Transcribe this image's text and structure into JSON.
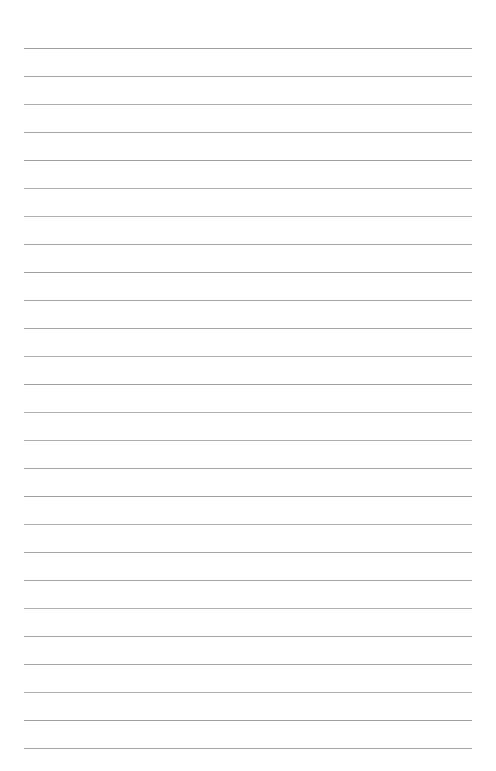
{
  "document": {
    "kind": "lined-paper",
    "title": "",
    "body_text": "",
    "page_number": "",
    "header_text": "",
    "footer_text": ""
  },
  "canvas": {
    "width": 496,
    "height": 771,
    "background_color": "#ffffff"
  },
  "ruling": {
    "line_color": "#9e9e9e",
    "line_thickness_px": 1,
    "line_spacing_px": 28,
    "first_line_y_px": 48,
    "last_line_y_px": 748,
    "line_start_x_px": 24,
    "line_end_x_px": 472,
    "line_count": 26,
    "lines_y": [
      48,
      76,
      104,
      132,
      160,
      188,
      216,
      244,
      272,
      300,
      328,
      356,
      384,
      412,
      440,
      468,
      496,
      524,
      552,
      580,
      608,
      636,
      664,
      692,
      720,
      748
    ],
    "margin_rule_visible": false,
    "top_margin_px": 48,
    "bottom_margin_px": 23,
    "left_margin_px": 24,
    "right_margin_px": 24
  }
}
